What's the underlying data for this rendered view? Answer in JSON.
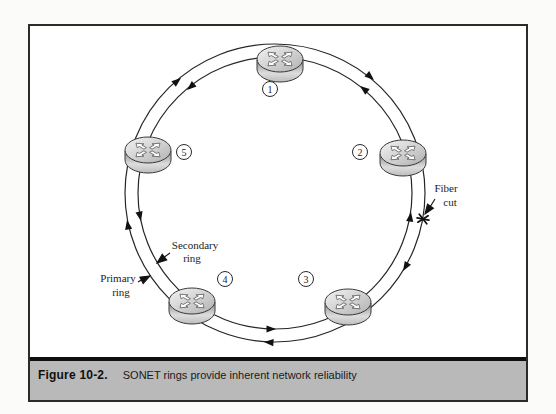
{
  "figure": {
    "label": "Figure 10-2.",
    "caption": "SONET rings provide inherent network reliability"
  },
  "diagram": {
    "nodes": [
      {
        "id": "router-1",
        "label": "1"
      },
      {
        "id": "router-2",
        "label": "2"
      },
      {
        "id": "router-3",
        "label": "3"
      },
      {
        "id": "router-4",
        "label": "4"
      },
      {
        "id": "router-5",
        "label": "5"
      }
    ],
    "annotations": {
      "fiber_cut": {
        "line1": "Fiber",
        "line2": "cut"
      },
      "secondary_ring": {
        "line1": "Secondary",
        "line2": "ring"
      },
      "primary_ring": {
        "line1": "Primary",
        "line2": "ring"
      }
    }
  },
  "colors": {
    "page_bg": "#fbfbf9",
    "frame_border": "#2b2b2b",
    "caption_bar_bg": "#b9b9b9",
    "ink": "#1c1c1c",
    "router_top_light": "#f4f4f4",
    "router_top_dark": "#b0b0b0",
    "router_side_dark": "#8e8e8e",
    "router_side_light": "#dddddd"
  }
}
